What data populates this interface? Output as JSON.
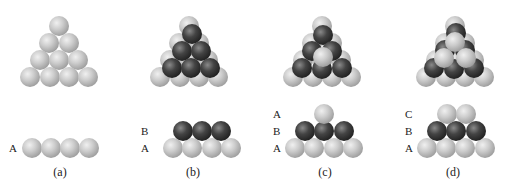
{
  "diagram": {
    "colors": {
      "light": "#c6c6c6",
      "dark": "#3c3c3c",
      "text": "#222222"
    },
    "sphere_radius": 10,
    "panels": [
      {
        "id": "a",
        "caption": "(a)",
        "caption_pos": [
          60,
          176
        ],
        "layer_labels": [
          {
            "text": "A",
            "x": 9,
            "y": 152
          }
        ],
        "top_view": [
          {
            "c": "light",
            "x": 59,
            "y": 26
          },
          {
            "c": "light",
            "x": 49,
            "y": 43
          },
          {
            "c": "light",
            "x": 69,
            "y": 43
          },
          {
            "c": "light",
            "x": 40,
            "y": 60
          },
          {
            "c": "light",
            "x": 59,
            "y": 60
          },
          {
            "c": "light",
            "x": 78,
            "y": 60
          },
          {
            "c": "light",
            "x": 30,
            "y": 77
          },
          {
            "c": "light",
            "x": 50,
            "y": 77
          },
          {
            "c": "light",
            "x": 69,
            "y": 77
          },
          {
            "c": "light",
            "x": 88,
            "y": 77
          }
        ],
        "side_view": [
          {
            "c": "light",
            "x": 32,
            "y": 148
          },
          {
            "c": "light",
            "x": 51,
            "y": 148
          },
          {
            "c": "light",
            "x": 70,
            "y": 148
          },
          {
            "c": "light",
            "x": 89,
            "y": 148
          }
        ]
      },
      {
        "id": "b",
        "caption": "(b)",
        "caption_pos": [
          193,
          176
        ],
        "layer_labels": [
          {
            "text": "B",
            "x": 141,
            "y": 135
          },
          {
            "text": "A",
            "x": 141,
            "y": 152
          }
        ],
        "top_view": [
          {
            "c": "light",
            "x": 189,
            "y": 26
          },
          {
            "c": "light",
            "x": 179,
            "y": 43
          },
          {
            "c": "light",
            "x": 199,
            "y": 43
          },
          {
            "c": "light",
            "x": 170,
            "y": 60
          },
          {
            "c": "light",
            "x": 189,
            "y": 60
          },
          {
            "c": "light",
            "x": 208,
            "y": 60
          },
          {
            "c": "light",
            "x": 160,
            "y": 77
          },
          {
            "c": "light",
            "x": 180,
            "y": 77
          },
          {
            "c": "light",
            "x": 199,
            "y": 77
          },
          {
            "c": "light",
            "x": 218,
            "y": 77
          },
          {
            "c": "dark",
            "x": 192,
            "y": 34
          },
          {
            "c": "dark",
            "x": 182,
            "y": 51
          },
          {
            "c": "dark",
            "x": 201,
            "y": 51
          },
          {
            "c": "dark",
            "x": 172,
            "y": 68
          },
          {
            "c": "dark",
            "x": 191,
            "y": 68
          },
          {
            "c": "dark",
            "x": 210,
            "y": 68
          }
        ],
        "side_view": [
          {
            "c": "light",
            "x": 173,
            "y": 148
          },
          {
            "c": "light",
            "x": 192,
            "y": 148
          },
          {
            "c": "light",
            "x": 212,
            "y": 148
          },
          {
            "c": "light",
            "x": 231,
            "y": 148
          },
          {
            "c": "dark",
            "x": 183,
            "y": 131
          },
          {
            "c": "dark",
            "x": 202,
            "y": 131
          },
          {
            "c": "dark",
            "x": 221,
            "y": 131
          }
        ]
      },
      {
        "id": "c",
        "caption": "(c)",
        "caption_pos": [
          325,
          176
        ],
        "layer_labels": [
          {
            "text": "A",
            "x": 273,
            "y": 118
          },
          {
            "text": "B",
            "x": 273,
            "y": 135
          },
          {
            "text": "A",
            "x": 273,
            "y": 152
          }
        ],
        "top_view": [
          {
            "c": "light",
            "x": 322,
            "y": 26
          },
          {
            "c": "light",
            "x": 312,
            "y": 43
          },
          {
            "c": "light",
            "x": 332,
            "y": 43
          },
          {
            "c": "light",
            "x": 303,
            "y": 60
          },
          {
            "c": "light",
            "x": 322,
            "y": 60
          },
          {
            "c": "light",
            "x": 341,
            "y": 60
          },
          {
            "c": "light",
            "x": 293,
            "y": 77
          },
          {
            "c": "light",
            "x": 313,
            "y": 77
          },
          {
            "c": "light",
            "x": 332,
            "y": 77
          },
          {
            "c": "light",
            "x": 351,
            "y": 77
          },
          {
            "c": "dark",
            "x": 323,
            "y": 35
          },
          {
            "c": "dark",
            "x": 312,
            "y": 51
          },
          {
            "c": "dark",
            "x": 332,
            "y": 51
          },
          {
            "c": "dark",
            "x": 302,
            "y": 68
          },
          {
            "c": "dark",
            "x": 322,
            "y": 69
          },
          {
            "c": "dark",
            "x": 342,
            "y": 68
          },
          {
            "c": "light",
            "x": 323,
            "y": 57
          }
        ],
        "side_view": [
          {
            "c": "light",
            "x": 295,
            "y": 148
          },
          {
            "c": "light",
            "x": 314,
            "y": 148
          },
          {
            "c": "light",
            "x": 334,
            "y": 148
          },
          {
            "c": "light",
            "x": 353,
            "y": 148
          },
          {
            "c": "dark",
            "x": 305,
            "y": 131
          },
          {
            "c": "dark",
            "x": 324,
            "y": 131
          },
          {
            "c": "dark",
            "x": 344,
            "y": 131
          },
          {
            "c": "light",
            "x": 324,
            "y": 114
          }
        ]
      },
      {
        "id": "d",
        "caption": "(d)",
        "caption_pos": [
          453,
          176
        ],
        "layer_labels": [
          {
            "text": "C",
            "x": 405,
            "y": 118
          },
          {
            "text": "B",
            "x": 405,
            "y": 135
          },
          {
            "text": "A",
            "x": 405,
            "y": 152
          }
        ],
        "top_view": [
          {
            "c": "light",
            "x": 455,
            "y": 26
          },
          {
            "c": "light",
            "x": 445,
            "y": 43
          },
          {
            "c": "light",
            "x": 465,
            "y": 43
          },
          {
            "c": "light",
            "x": 436,
            "y": 60
          },
          {
            "c": "light",
            "x": 455,
            "y": 60
          },
          {
            "c": "light",
            "x": 474,
            "y": 60
          },
          {
            "c": "light",
            "x": 426,
            "y": 77
          },
          {
            "c": "light",
            "x": 446,
            "y": 77
          },
          {
            "c": "light",
            "x": 465,
            "y": 77
          },
          {
            "c": "light",
            "x": 484,
            "y": 77
          },
          {
            "c": "dark",
            "x": 456,
            "y": 33
          },
          {
            "c": "dark",
            "x": 445,
            "y": 50
          },
          {
            "c": "dark",
            "x": 465,
            "y": 50
          },
          {
            "c": "dark",
            "x": 434,
            "y": 68
          },
          {
            "c": "dark",
            "x": 454,
            "y": 69
          },
          {
            "c": "dark",
            "x": 474,
            "y": 68
          },
          {
            "c": "light",
            "x": 455,
            "y": 42
          },
          {
            "c": "light",
            "x": 444,
            "y": 58
          },
          {
            "c": "light",
            "x": 466,
            "y": 58
          }
        ],
        "side_view": [
          {
            "c": "light",
            "x": 427,
            "y": 148
          },
          {
            "c": "light",
            "x": 446,
            "y": 148
          },
          {
            "c": "light",
            "x": 465,
            "y": 148
          },
          {
            "c": "light",
            "x": 485,
            "y": 148
          },
          {
            "c": "dark",
            "x": 437,
            "y": 131
          },
          {
            "c": "dark",
            "x": 456,
            "y": 131
          },
          {
            "c": "dark",
            "x": 476,
            "y": 131
          },
          {
            "c": "light",
            "x": 447,
            "y": 114
          },
          {
            "c": "light",
            "x": 466,
            "y": 114
          }
        ]
      }
    ]
  }
}
